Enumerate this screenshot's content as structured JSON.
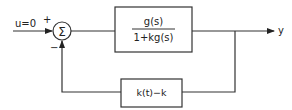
{
  "diagram": {
    "type": "block-diagram",
    "input_label": "u=0",
    "plus_sign": "+",
    "minus_sign": "−",
    "summer_symbol": "Σ",
    "forward_block": {
      "numerator": "g(s)",
      "denominator": "1+kg(s)"
    },
    "feedback_block": {
      "label": "k(t)−k"
    },
    "output_label": "y",
    "stroke_color": "#333333"
  }
}
